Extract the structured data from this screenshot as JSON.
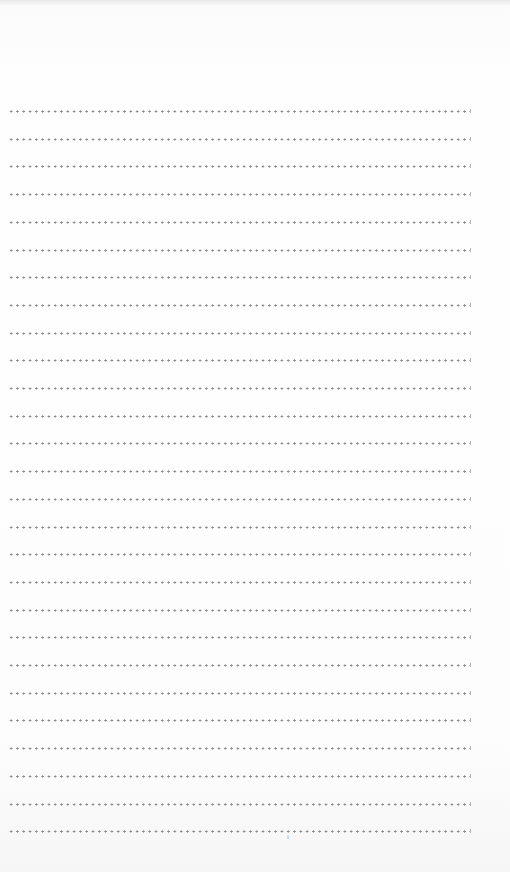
{
  "document": {
    "type": "ruled writing page",
    "line_style": "dotted",
    "line_count": 27,
    "first_line_y": 111,
    "line_spacing_px": 27.7,
    "line_color": "#8a8a8a",
    "background_color": "#fdfdfd",
    "page_mark": "i"
  }
}
